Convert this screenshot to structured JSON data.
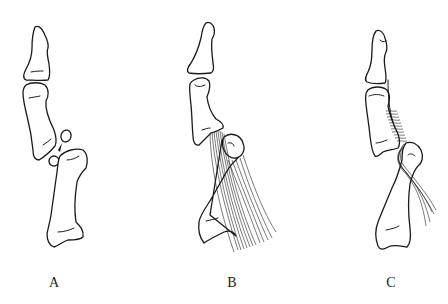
{
  "figure": {
    "panels": [
      {
        "id": "A",
        "label": "A",
        "description": "Thumb bones with avulsed sesamoid fragment at MCP joint"
      },
      {
        "id": "B",
        "label": "B",
        "description": "Thumb bones with ligament fibers spanning MCP joint"
      },
      {
        "id": "C",
        "label": "C",
        "description": "Thumb bones with sutured/wrapped ligament repair"
      }
    ],
    "colors": {
      "background": "#ffffff",
      "line": "#1a1a1a"
    }
  }
}
